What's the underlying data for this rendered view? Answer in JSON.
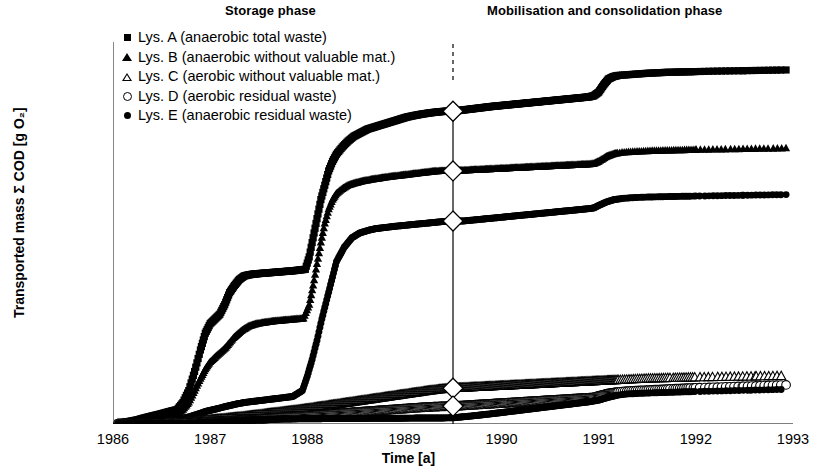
{
  "annotations": {
    "storage_phase": "Storage phase",
    "mobilisation_phase": "Mobilisation and consolidation phase"
  },
  "axes": {
    "ylabel": "Transported mass Σ COD [g O₂]",
    "xlabel": "Time [a]",
    "yticks": [
      "0",
      "20 000",
      "40 000",
      "60 000",
      "80 000",
      "100 000",
      "120 000",
      "140 000",
      "160 000"
    ],
    "xticks": [
      "1986",
      "1987",
      "1988",
      "1989",
      "1990",
      "1991",
      "1992",
      "1993"
    ]
  },
  "legend": [
    {
      "marker": "filled-square",
      "label": "Lys. A (anaerobic total waste)"
    },
    {
      "marker": "filled-triangle",
      "label": "Lys. B (anaerobic without valuable mat.)"
    },
    {
      "marker": "open-triangle",
      "label": "Lys. C (aerobic without valuable mat.)"
    },
    {
      "marker": "open-circle",
      "label": "Lys. D (aerobic residual waste)"
    },
    {
      "marker": "filled-circle",
      "label": "Lys. E (anaerobic residual waste)"
    }
  ],
  "chart_data": {
    "type": "scatter",
    "title": "",
    "xlabel": "Time [a]",
    "ylabel": "Transported mass Σ COD [g O₂]",
    "xlim": [
      1986,
      1993
    ],
    "ylim": [
      0,
      160000
    ],
    "ytick_step": 20000,
    "grid": false,
    "legend_position": "top-left",
    "phase_divider": {
      "x": 1989.5,
      "label_left": "Storage phase",
      "label_right": "Mobilisation and consolidation phase",
      "marker": "open-diamond"
    },
    "phase_divider_markers": [
      {
        "series": "Lys. A",
        "x": 1989.5,
        "y": 131000
      },
      {
        "series": "Lys. B",
        "x": 1989.5,
        "y": 106000
      },
      {
        "series": "Lys. E",
        "x": 1989.5,
        "y": 85000
      },
      {
        "series": "Lys. C",
        "x": 1989.5,
        "y": 15000
      },
      {
        "series": "Lys. D",
        "x": 1989.5,
        "y": 7500
      }
    ],
    "series": [
      {
        "name": "Lys. A (anaerobic total waste)",
        "marker": "filled-square",
        "fill": "#000000",
        "x": [
          1986.05,
          1986.15,
          1986.25,
          1986.33,
          1986.42,
          1986.5,
          1986.58,
          1986.66,
          1986.72,
          1986.78,
          1986.84,
          1986.9,
          1986.95,
          1987.0,
          1987.05,
          1987.1,
          1987.15,
          1987.2,
          1987.25,
          1987.3,
          1987.35,
          1987.4,
          1987.45,
          1987.5,
          1987.56,
          1987.62,
          1987.68,
          1987.74,
          1987.8,
          1987.86,
          1987.92,
          1987.98,
          1988.02,
          1988.06,
          1988.1,
          1988.14,
          1988.18,
          1988.22,
          1988.26,
          1988.3,
          1988.36,
          1988.42,
          1988.48,
          1988.55,
          1988.62,
          1988.7,
          1988.78,
          1988.86,
          1988.94,
          1989.02,
          1989.1,
          1989.18,
          1989.26,
          1989.34,
          1989.42,
          1989.5,
          1989.6,
          1989.7,
          1989.8,
          1989.9,
          1990.0,
          1990.1,
          1990.2,
          1990.3,
          1990.4,
          1990.5,
          1990.6,
          1990.7,
          1990.8,
          1990.9,
          1990.95,
          1991.0,
          1991.05,
          1991.1,
          1991.15,
          1991.2,
          1991.3,
          1991.4,
          1991.5,
          1991.6,
          1991.7,
          1991.8,
          1991.9,
          1992.0,
          1992.1,
          1992.2,
          1992.35,
          1992.5,
          1992.65,
          1992.8,
          1992.95
        ],
        "y": [
          300,
          900,
          1700,
          2600,
          3500,
          4300,
          5200,
          6000,
          9000,
          14000,
          22000,
          31000,
          38000,
          42000,
          44000,
          46000,
          50000,
          55000,
          58000,
          60500,
          62000,
          62500,
          62800,
          63000,
          63200,
          63400,
          63600,
          63800,
          64000,
          64200,
          64500,
          64800,
          70000,
          78000,
          86000,
          94000,
          100000,
          106000,
          110000,
          113000,
          116000,
          118500,
          120500,
          122000,
          123500,
          124500,
          125500,
          126500,
          127500,
          128500,
          129200,
          129800,
          130300,
          130700,
          131000,
          131000,
          131500,
          132000,
          132500,
          133000,
          133400,
          133800,
          134200,
          134600,
          135000,
          135400,
          135800,
          136200,
          136600,
          137000,
          137500,
          139000,
          142000,
          144500,
          145500,
          146000,
          146300,
          146600,
          146900,
          147100,
          147300,
          147400,
          147500,
          147600,
          147700,
          147800,
          147900,
          148000,
          148100,
          148200,
          148300
        ]
      },
      {
        "name": "Lys. B (anaerobic without valuable mat.)",
        "marker": "filled-triangle",
        "fill": "#000000",
        "x": [
          1986.05,
          1986.15,
          1986.25,
          1986.33,
          1986.42,
          1986.5,
          1986.58,
          1986.66,
          1986.72,
          1986.78,
          1986.84,
          1986.9,
          1986.95,
          1987.0,
          1987.08,
          1987.16,
          1987.24,
          1987.32,
          1987.4,
          1987.48,
          1987.56,
          1987.64,
          1987.72,
          1987.8,
          1987.88,
          1987.96,
          1988.02,
          1988.06,
          1988.1,
          1988.14,
          1988.18,
          1988.22,
          1988.26,
          1988.3,
          1988.36,
          1988.42,
          1988.5,
          1988.58,
          1988.66,
          1988.74,
          1988.82,
          1988.9,
          1988.98,
          1989.06,
          1989.14,
          1989.22,
          1989.3,
          1989.38,
          1989.46,
          1989.5,
          1989.6,
          1989.7,
          1989.8,
          1989.9,
          1990.0,
          1990.1,
          1990.2,
          1990.3,
          1990.4,
          1990.5,
          1990.6,
          1990.7,
          1990.8,
          1990.9,
          1990.95,
          1991.0,
          1991.08,
          1991.16,
          1991.24,
          1991.35,
          1991.45,
          1991.55,
          1991.65,
          1991.75,
          1991.85,
          1991.95,
          1992.1,
          1992.25,
          1992.4,
          1992.55,
          1992.7,
          1992.85,
          1992.95
        ],
        "y": [
          200,
          600,
          1200,
          1900,
          2600,
          3200,
          3800,
          4400,
          6000,
          9000,
          14000,
          19000,
          23000,
          26000,
          29000,
          32000,
          36000,
          39000,
          41000,
          42000,
          42500,
          43000,
          43300,
          43600,
          43900,
          44200,
          50000,
          58000,
          67000,
          76000,
          84000,
          90000,
          94000,
          96500,
          98500,
          100000,
          101000,
          101800,
          102400,
          102900,
          103400,
          103800,
          104200,
          104600,
          105000,
          105400,
          105800,
          106000,
          106000,
          106000,
          106200,
          106400,
          106600,
          106800,
          107000,
          107200,
          107400,
          107600,
          107800,
          108000,
          108200,
          108400,
          108600,
          108800,
          109000,
          110000,
          112000,
          113200,
          113700,
          114000,
          114200,
          114400,
          114500,
          114600,
          114700,
          114800,
          114900,
          115000,
          115100,
          115200,
          115300,
          115400,
          115500
        ]
      },
      {
        "name": "Lys. E (anaerobic residual waste)",
        "marker": "filled-circle",
        "fill": "#000000",
        "x": [
          1986.05,
          1986.2,
          1986.35,
          1986.5,
          1986.62,
          1986.72,
          1986.8,
          1986.88,
          1986.95,
          1987.05,
          1987.15,
          1987.25,
          1987.35,
          1987.45,
          1987.55,
          1987.65,
          1987.75,
          1987.85,
          1987.95,
          1988.0,
          1988.05,
          1988.1,
          1988.15,
          1988.2,
          1988.25,
          1988.3,
          1988.38,
          1988.46,
          1988.54,
          1988.62,
          1988.7,
          1988.8,
          1988.9,
          1989.0,
          1989.1,
          1989.2,
          1989.3,
          1989.4,
          1989.5,
          1989.6,
          1989.7,
          1989.8,
          1989.9,
          1990.0,
          1990.1,
          1990.2,
          1990.3,
          1990.4,
          1990.5,
          1990.6,
          1990.7,
          1990.8,
          1990.9,
          1990.95,
          1991.0,
          1991.08,
          1991.16,
          1991.25,
          1991.35,
          1991.45,
          1991.55,
          1991.65,
          1991.78,
          1991.9,
          1992.05,
          1992.2,
          1992.35,
          1992.5,
          1992.65,
          1992.8,
          1992.95
        ],
        "y": [
          150,
          400,
          800,
          1300,
          1800,
          2400,
          3200,
          4200,
          5200,
          6200,
          7200,
          8200,
          9000,
          9500,
          10000,
          10500,
          11000,
          11500,
          14000,
          20000,
          27000,
          35000,
          44000,
          52000,
          60000,
          68000,
          74000,
          78000,
          80000,
          81000,
          81800,
          82300,
          82800,
          83200,
          83600,
          84000,
          84400,
          84800,
          85000,
          85000,
          85400,
          85800,
          86200,
          86600,
          87000,
          87400,
          87800,
          88200,
          88600,
          89000,
          89400,
          89800,
          90200,
          90500,
          91500,
          93000,
          94000,
          94500,
          94800,
          95000,
          95100,
          95200,
          95300,
          95400,
          95500,
          95600,
          95700,
          95800,
          95900,
          96000,
          96100
        ]
      },
      {
        "name": "Lys. C (aerobic without valuable mat.)",
        "marker": "open-triangle",
        "fill": "#ffffff",
        "x": [
          1986.05,
          1986.2,
          1986.35,
          1986.5,
          1986.62,
          1986.72,
          1986.82,
          1986.92,
          1987.0,
          1987.12,
          1987.24,
          1987.36,
          1987.48,
          1987.6,
          1987.72,
          1987.84,
          1987.96,
          1988.06,
          1988.16,
          1988.26,
          1988.36,
          1988.46,
          1988.56,
          1988.66,
          1988.76,
          1988.86,
          1988.96,
          1989.06,
          1989.16,
          1989.26,
          1989.36,
          1989.46,
          1989.5,
          1989.6,
          1989.7,
          1989.8,
          1989.9,
          1990.0,
          1990.1,
          1990.2,
          1990.3,
          1990.4,
          1990.5,
          1990.6,
          1990.7,
          1990.8,
          1990.9,
          1991.0,
          1991.1,
          1991.2,
          1991.3,
          1991.4,
          1991.5,
          1991.6,
          1991.7,
          1991.8,
          1991.9,
          1992.0,
          1992.15,
          1992.3,
          1992.45,
          1992.6,
          1992.75,
          1992.9
        ],
        "y": [
          60,
          150,
          300,
          500,
          700,
          950,
          1200,
          1500,
          1800,
          2200,
          2700,
          3200,
          3800,
          4400,
          5000,
          5600,
          6200,
          6800,
          7400,
          8000,
          8600,
          9200,
          9800,
          10400,
          11000,
          11600,
          12200,
          12800,
          13400,
          14000,
          14500,
          14900,
          15000,
          15200,
          15400,
          15600,
          15800,
          16000,
          16200,
          16400,
          16600,
          16800,
          17000,
          17200,
          17400,
          17600,
          17800,
          18000,
          18200,
          18400,
          18600,
          18800,
          19000,
          19100,
          19200,
          19300,
          19400,
          19500,
          19600,
          19700,
          19800,
          19900,
          20000,
          20100
        ]
      },
      {
        "name": "Lys. D (aerobic residual waste)",
        "marker": "open-circle",
        "fill": "#ffffff",
        "x": [
          1986.05,
          1986.2,
          1986.35,
          1986.5,
          1986.62,
          1986.75,
          1986.88,
          1987.0,
          1987.12,
          1987.24,
          1987.36,
          1987.48,
          1987.6,
          1987.72,
          1987.84,
          1987.96,
          1988.08,
          1988.2,
          1988.32,
          1988.44,
          1988.56,
          1988.68,
          1988.8,
          1988.92,
          1989.04,
          1989.16,
          1989.28,
          1989.4,
          1989.5,
          1989.62,
          1989.74,
          1989.86,
          1989.98,
          1990.1,
          1990.22,
          1990.34,
          1990.46,
          1990.58,
          1990.7,
          1990.82,
          1990.94,
          1991.0,
          1991.1,
          1991.2,
          1991.3,
          1991.4,
          1991.5,
          1991.6,
          1991.7,
          1991.8,
          1991.9,
          1992.05,
          1992.2,
          1992.35,
          1992.5,
          1992.65,
          1992.8,
          1992.95
        ],
        "y": [
          40,
          90,
          180,
          300,
          420,
          560,
          700,
          850,
          1100,
          1400,
          1700,
          2000,
          2350,
          2700,
          3050,
          3400,
          3750,
          4100,
          4450,
          4800,
          5150,
          5500,
          5850,
          6200,
          6550,
          6900,
          7200,
          7400,
          7500,
          7800,
          8100,
          8400,
          8700,
          9000,
          9300,
          9600,
          9900,
          10200,
          10500,
          10800,
          11100,
          11800,
          12800,
          13400,
          13800,
          14000,
          14200,
          14400,
          14600,
          14800,
          15000,
          15200,
          15400,
          15600,
          15800,
          16000,
          16200,
          16400
        ]
      },
      {
        "name": "Lys. E low (anaerobic residual waste) - lower trace",
        "marker": "filled-circle",
        "fill": "#000000",
        "note": "dense black band near baseline rising after 1989.5",
        "x": [
          1986.05,
          1986.2,
          1986.4,
          1986.6,
          1986.75,
          1986.9,
          1987.0,
          1987.1,
          1987.2,
          1987.3,
          1987.45,
          1987.6,
          1987.75,
          1987.9,
          1988.0,
          1988.2,
          1988.4,
          1988.6,
          1988.8,
          1989.0,
          1989.2,
          1989.4,
          1989.5,
          1989.7,
          1989.9,
          1990.1,
          1990.3,
          1990.5,
          1990.7,
          1990.9,
          1991.0,
          1991.1,
          1991.2,
          1991.3,
          1991.45,
          1991.6,
          1991.75,
          1991.9,
          1992.1,
          1992.3,
          1992.5,
          1992.7,
          1992.9
        ],
        "y": [
          30,
          80,
          160,
          260,
          380,
          520,
          680,
          900,
          1200,
          1500,
          1800,
          2000,
          2100,
          2150,
          2200,
          2250,
          2300,
          2350,
          2400,
          2450,
          2500,
          2550,
          2600,
          3400,
          4300,
          5300,
          6300,
          7300,
          8300,
          9300,
          10000,
          11200,
          12100,
          12600,
          12900,
          13100,
          13300,
          13500,
          13700,
          13900,
          14100,
          14300,
          14500
        ]
      }
    ]
  }
}
